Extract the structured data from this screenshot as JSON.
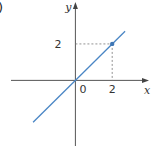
{
  "panel_label": ")",
  "chart_data": {
    "type": "line",
    "title": "",
    "xlabel": "x",
    "ylabel": "y",
    "origin_label": "0",
    "xlim": [
      -3.5,
      4
    ],
    "ylim": [
      -3.6,
      4.3
    ],
    "x_ticks": [
      {
        "value": 2,
        "label": "2"
      }
    ],
    "y_ticks": [
      {
        "value": 2,
        "label": "2"
      }
    ],
    "grid": false,
    "series": [
      {
        "name": "y = x",
        "x": [
          -2.3,
          2.7
        ],
        "y": [
          -2.3,
          2.7
        ],
        "color": "#4a86c5"
      }
    ],
    "highlight_points": [
      {
        "x": 2,
        "y": 2,
        "color": "#3f77b5",
        "guides": true
      }
    ]
  }
}
